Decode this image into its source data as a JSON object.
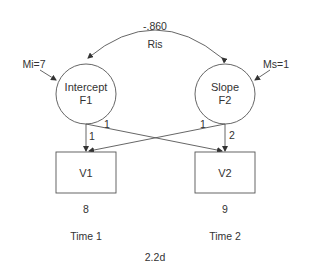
{
  "diagram": {
    "figure_label": "2.2d",
    "colors": {
      "stroke": "#555555",
      "text": "#333333",
      "background": "#ffffff"
    },
    "covariance": {
      "value": "-.860",
      "label": "Ris"
    },
    "latent_factors": [
      {
        "id": "F1",
        "name": "Intercept",
        "code": "F1",
        "mean_label": "Mi=7"
      },
      {
        "id": "F2",
        "name": "Slope",
        "code": "F2",
        "mean_label": "Ms=1"
      }
    ],
    "observed": [
      {
        "id": "V1",
        "label": "V1",
        "value": "8",
        "time": "Time 1"
      },
      {
        "id": "V2",
        "label": "V2",
        "value": "9",
        "time": "Time 2"
      }
    ],
    "loadings": [
      {
        "from": "F1",
        "to": "V1",
        "label": "1"
      },
      {
        "from": "F1",
        "to": "V2",
        "label": "1"
      },
      {
        "from": "F2",
        "to": "V1",
        "label": "1"
      },
      {
        "from": "F2",
        "to": "V2",
        "label": "2"
      }
    ]
  }
}
